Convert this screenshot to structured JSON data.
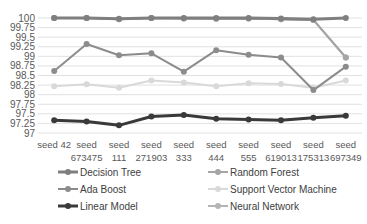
{
  "chart_data": {
    "type": "line",
    "title": "",
    "xlabel": "",
    "ylabel": "",
    "ylim": [
      97,
      100
    ],
    "yticks": [
      "100",
      "99.75",
      "99.5",
      "99.25",
      "99",
      "98.75",
      "98.5",
      "98.25",
      "98",
      "97.75",
      "97.5",
      "97.25",
      "97"
    ],
    "grid": true,
    "legend_position": "bottom",
    "categories": [
      "seed 42",
      "seed 673475",
      "seed 111",
      "seed 271903",
      "seed 333",
      "seed 444",
      "seed 555",
      "seed 619013",
      "seed 175313",
      "seed 697349"
    ],
    "category_lines": [
      [
        "seed 42"
      ],
      [
        "seed",
        "673475"
      ],
      [
        "seed",
        "111"
      ],
      [
        "seed",
        "271903"
      ],
      [
        "seed",
        "333"
      ],
      [
        "seed",
        "444"
      ],
      [
        "seed",
        "555"
      ],
      [
        "seed",
        "619013"
      ],
      [
        "seed",
        "175313"
      ],
      [
        "seed",
        "697349"
      ]
    ],
    "series": [
      {
        "name": "Decision Tree",
        "color": "#7f7f7f",
        "width": 3,
        "values": [
          100,
          100,
          99.98,
          100,
          100,
          100,
          100,
          99.99,
          99.97,
          100
        ]
      },
      {
        "name": "Random Forest",
        "color": "#a5a5a5",
        "width": 2,
        "values": [
          100,
          100,
          99.97,
          100,
          99.99,
          99.98,
          99.99,
          99.97,
          99.95,
          98.97
        ]
      },
      {
        "name": "Ada Boost",
        "color": "#8c8c8c",
        "width": 2,
        "values": [
          98.62,
          99.32,
          99.03,
          99.08,
          98.6,
          99.16,
          99.04,
          98.97,
          98.12,
          98.73
        ]
      },
      {
        "name": "Support Vector Machine",
        "color": "#d9d9d9",
        "width": 2,
        "values": [
          98.22,
          98.27,
          98.18,
          98.37,
          98.32,
          98.22,
          98.3,
          98.28,
          98.18,
          98.37
        ]
      },
      {
        "name": "Linear Model",
        "color": "#3a3a3a",
        "width": 3,
        "values": [
          97.33,
          97.3,
          97.2,
          97.43,
          97.47,
          97.37,
          97.35,
          97.33,
          97.4,
          97.45
        ]
      },
      {
        "name": "Neural Network",
        "color": "#b4b4b4",
        "width": 2,
        "values": [
          100,
          100,
          99.97,
          100,
          99.99,
          99.98,
          99.99,
          99.97,
          99.95,
          98.97
        ]
      }
    ]
  }
}
